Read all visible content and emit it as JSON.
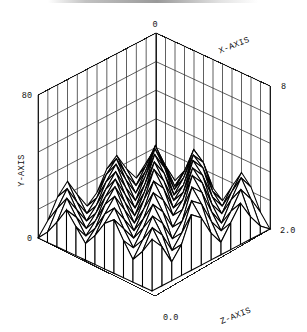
{
  "figure": {
    "name": "3d-surface-wireframe-plot",
    "background_color": "#ffffff",
    "line_color": "#000000",
    "face_color": "#ffffff",
    "width": 307,
    "height": 332
  },
  "chart_data": {
    "type": "surface",
    "title": "",
    "subtitle": "",
    "xlabel": "X-AXIS",
    "ylabel": "Y-AXIS",
    "zlabel": "Z-AXIS",
    "x_ticks": [
      "0",
      "8"
    ],
    "y_ticks": [
      "0",
      "80"
    ],
    "z_ticks": [
      "0.0",
      "2.0"
    ],
    "xlim": [
      0,
      8
    ],
    "ylim": [
      0,
      80
    ],
    "zlim": [
      0.0,
      2.0
    ],
    "grid": true,
    "legend": null,
    "legend_position": "none",
    "nx": 13,
    "nz": 13,
    "wall_grid_rows": 5,
    "projection": {
      "note": "isometric-style box, viewer at front-bottom corner",
      "top_vertex": [
        156,
        33
      ],
      "left_vertex": [
        38,
        95
      ],
      "right_vertex": [
        270,
        86
      ],
      "front_vertex": [
        155,
        153
      ],
      "base_drop": 143
    },
    "values": [
      [
        38,
        30,
        26,
        33,
        44,
        41,
        31,
        27,
        36,
        45,
        40,
        30,
        24
      ],
      [
        33,
        41,
        36,
        28,
        37,
        50,
        46,
        34,
        29,
        38,
        47,
        39,
        28
      ],
      [
        28,
        36,
        48,
        40,
        31,
        39,
        52,
        48,
        36,
        30,
        39,
        46,
        35
      ],
      [
        35,
        29,
        38,
        51,
        44,
        33,
        40,
        54,
        49,
        37,
        30,
        38,
        44
      ],
      [
        44,
        37,
        30,
        40,
        53,
        46,
        35,
        41,
        55,
        50,
        38,
        31,
        37
      ],
      [
        40,
        47,
        39,
        31,
        41,
        54,
        47,
        36,
        42,
        56,
        50,
        38,
        30
      ],
      [
        31,
        42,
        49,
        40,
        32,
        42,
        55,
        48,
        37,
        42,
        55,
        49,
        37
      ],
      [
        27,
        33,
        43,
        50,
        41,
        33,
        43,
        54,
        47,
        36,
        41,
        53,
        47
      ],
      [
        35,
        28,
        34,
        44,
        51,
        42,
        34,
        43,
        53,
        46,
        35,
        40,
        51
      ],
      [
        44,
        36,
        29,
        35,
        45,
        52,
        43,
        35,
        43,
        52,
        45,
        34,
        39
      ],
      [
        39,
        45,
        37,
        30,
        36,
        46,
        52,
        43,
        36,
        43,
        51,
        44,
        33
      ],
      [
        30,
        38,
        45,
        38,
        31,
        37,
        46,
        51,
        43,
        36,
        42,
        50,
        43
      ],
      [
        24,
        29,
        36,
        44,
        38,
        32,
        38,
        46,
        50,
        42,
        35,
        41,
        49
      ]
    ]
  },
  "labels": {
    "x_axis_title": "X-AXIS",
    "y_axis_title": "Y-AXIS",
    "z_axis_title": "Z-AXIS",
    "x_tick_min": "0",
    "x_tick_max": "8",
    "y_tick_min": "0",
    "y_tick_max": "80",
    "z_tick_min": "0.0",
    "z_tick_max": "2.0"
  }
}
